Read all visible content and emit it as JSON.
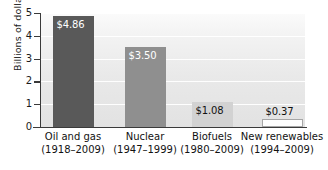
{
  "chart_data": {
    "type": "bar",
    "title": "",
    "xlabel": "",
    "ylabel": "Billions of dollars",
    "ylim": [
      0,
      5
    ],
    "yticks": [
      "0",
      "1",
      "2",
      "3",
      "4",
      "5"
    ],
    "grid": true,
    "legend": "none",
    "categories": [
      "Oil and gas",
      "Nuclear",
      "Biofuels",
      "New renewables"
    ],
    "category_sublabels": [
      "(1918–2009)",
      "(1947–1999)",
      "(1980–2009)",
      "(1994–2009)"
    ],
    "values": [
      4.86,
      3.5,
      1.08,
      0.37
    ],
    "value_labels": [
      "$4.86",
      "$3.50",
      "$1.08",
      "$0.37"
    ],
    "bar_colors": [
      "#595959",
      "#8f8f8f",
      "#d2d2d2",
      "#fdfdfd"
    ],
    "bar_label_colors": [
      "#ffffff",
      "#ffffff",
      "#111111",
      "#111111"
    ],
    "bar_border_colors": [
      "#595959",
      "#8f8f8f",
      "#d2d2d2",
      "#a6a6a6"
    ]
  },
  "colors": {
    "axis": "#3a3a3a",
    "gridline": "#ffffff",
    "plot_background": "#ededed",
    "text": "#1b1b1b",
    "page_background": "#ffffff"
  }
}
